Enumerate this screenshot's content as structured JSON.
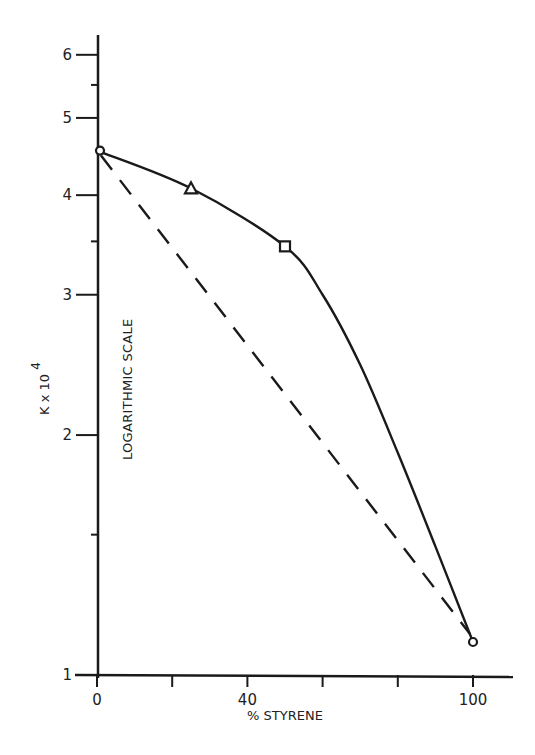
{
  "chart_data": {
    "type": "line",
    "title": "",
    "xlabel": "% STYRENE",
    "ylabel": "K x 10^4",
    "ylabel_parts": {
      "base": "K x 10",
      "exponent": "4"
    },
    "annotation": "LOGARITHMIC SCALE",
    "y_scale": "log",
    "xlim": [
      0,
      100
    ],
    "ylim": [
      1,
      6
    ],
    "x_ticks": [
      0,
      20,
      40,
      60,
      80,
      100
    ],
    "x_tick_labels": [
      "0",
      "",
      "40",
      "",
      "",
      "100"
    ],
    "y_ticks": [
      1,
      1.5,
      2,
      3,
      3.5,
      4,
      5,
      5.5,
      6
    ],
    "y_tick_labels": [
      "1",
      "",
      "2",
      "3",
      "",
      "4",
      "5",
      "",
      "6"
    ],
    "grid": false,
    "legend": null,
    "series": [
      {
        "name": "experimental",
        "style": "solid",
        "points": [
          {
            "x": 0,
            "y": 4.55,
            "marker": "circle"
          },
          {
            "x": 25,
            "y": 4.08,
            "marker": "triangle"
          },
          {
            "x": 50,
            "y": 3.45,
            "marker": "square"
          },
          {
            "x": 100,
            "y": 1.1,
            "marker": "circle"
          }
        ],
        "curve": [
          {
            "x": 0,
            "y": 4.55
          },
          {
            "x": 25,
            "y": 4.08
          },
          {
            "x": 50,
            "y": 3.45
          },
          {
            "x": 60,
            "y": 3.0
          },
          {
            "x": 70,
            "y": 2.45
          },
          {
            "x": 80,
            "y": 1.9
          },
          {
            "x": 90,
            "y": 1.45
          },
          {
            "x": 100,
            "y": 1.1
          }
        ]
      },
      {
        "name": "linear (log) interpolation",
        "style": "dashed",
        "points": [
          {
            "x": 0,
            "y": 4.55
          },
          {
            "x": 100,
            "y": 1.1
          }
        ]
      }
    ]
  }
}
